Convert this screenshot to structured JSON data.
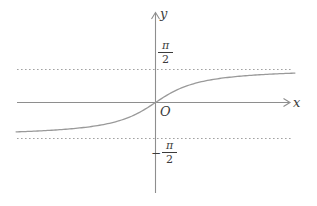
{
  "figure": {
    "background": "#ffffff",
    "axis_color": "#8e8e8e",
    "curve_color": "#9a9a9a",
    "asymptote_color": "#a2a2a2",
    "text_color": "#3b3b3b"
  },
  "labels": {
    "y_axis": "y",
    "x_axis": "x",
    "origin": "O"
  },
  "ticks": {
    "upper": {
      "numerator": "π",
      "denominator": "2",
      "value": "π/2"
    },
    "lower": {
      "sign": "−",
      "numerator": "π",
      "denominator": "2",
      "value": "−π/2"
    }
  },
  "chart_data": {
    "type": "line",
    "title": "",
    "function": "y = arctan(x)",
    "xlabel": "x",
    "ylabel": "y",
    "grid": false,
    "x_range": [
      -4.2,
      4.2
    ],
    "y_range": [
      -1.5708,
      1.5708
    ],
    "asymptotes": [
      {
        "y": 1.5708,
        "label": "π/2",
        "style": "dotted"
      },
      {
        "y": -1.5708,
        "label": "−π/2",
        "style": "dotted"
      }
    ],
    "key_points": [
      {
        "x": 0,
        "y": 0,
        "label": "O"
      }
    ],
    "samples": [
      [
        -4.2,
        -1.337
      ],
      [
        -3.5,
        -1.292
      ],
      [
        -2.8,
        -1.228
      ],
      [
        -2.1,
        -1.126
      ],
      [
        -1.4,
        -0.951
      ],
      [
        -0.7,
        -0.611
      ],
      [
        0,
        0
      ],
      [
        0.7,
        0.611
      ],
      [
        1.4,
        0.951
      ],
      [
        2.1,
        1.126
      ],
      [
        2.8,
        1.228
      ],
      [
        3.5,
        1.337
      ]
    ]
  }
}
